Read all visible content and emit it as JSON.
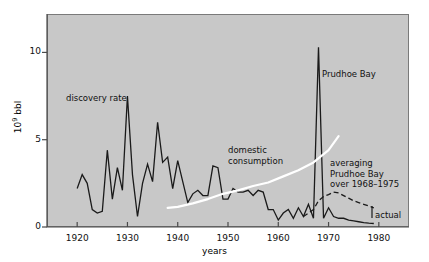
{
  "chart_data": {
    "type": "line",
    "title": "",
    "xlabel": "years",
    "ylabel_prefix": "10",
    "ylabel_exp": "9",
    "ylabel_suffix": " bbl",
    "xlim": [
      1914,
      1986
    ],
    "ylim": [
      0,
      12.2
    ],
    "xticks": [
      1920,
      1930,
      1940,
      1950,
      1960,
      1970,
      1980
    ],
    "xticklabels": [
      "1920",
      "1930",
      "1940",
      "1950",
      "1960",
      "1970",
      "1980"
    ],
    "yticks": [
      0,
      5,
      10
    ],
    "yticklabels": [
      "0",
      "5",
      "10"
    ],
    "grid": false,
    "legend": "none",
    "plot_bgcolor": "#c8c8c8",
    "series": [
      {
        "name": "discovery rate",
        "color": "#1a1a1a",
        "style": "solid",
        "x": [
          1920,
          1921,
          1922,
          1923,
          1924,
          1925,
          1926,
          1927,
          1928,
          1929,
          1930,
          1931,
          1932,
          1933,
          1934,
          1935,
          1936,
          1937,
          1938,
          1939,
          1940,
          1941,
          1942,
          1943,
          1944,
          1945,
          1946,
          1947,
          1948,
          1949,
          1950,
          1951,
          1952,
          1953,
          1954,
          1955,
          1956,
          1957,
          1958,
          1959,
          1960,
          1961,
          1962,
          1963,
          1964,
          1965,
          1966,
          1967,
          1968,
          1969,
          1970,
          1971,
          1972,
          1973,
          1974,
          1975,
          1976,
          1977,
          1978,
          1979
        ],
        "values": [
          2.2,
          3.0,
          2.5,
          1.0,
          0.8,
          0.9,
          4.4,
          1.6,
          3.4,
          2.1,
          7.5,
          3.0,
          0.6,
          2.5,
          3.6,
          2.6,
          6.0,
          3.7,
          4.0,
          2.2,
          3.8,
          2.6,
          1.4,
          1.9,
          2.1,
          1.8,
          1.8,
          3.5,
          3.4,
          1.6,
          1.6,
          2.2,
          2.0,
          2.0,
          2.1,
          1.8,
          2.1,
          2.0,
          1.0,
          1.0,
          0.4,
          0.8,
          1.0,
          0.5,
          1.1,
          0.6,
          1.3,
          0.5,
          10.3,
          0.5,
          1.1,
          0.6,
          0.5,
          0.5,
          0.4,
          0.35,
          0.3,
          0.25,
          0.22,
          0.2
        ]
      },
      {
        "name": "domestic consumption",
        "color": "#ffffff",
        "style": "solid",
        "x": [
          1938,
          1940,
          1943,
          1946,
          1949,
          1952,
          1955,
          1958,
          1961,
          1964,
          1967,
          1970,
          1972
        ],
        "values": [
          1.1,
          1.15,
          1.35,
          1.6,
          1.9,
          2.1,
          2.35,
          2.55,
          2.9,
          3.25,
          3.7,
          4.4,
          5.2
        ]
      },
      {
        "name": "averaging Prudhoe Bay over 1968-1975",
        "color": "#1a1a1a",
        "style": "dashed",
        "x": [
          1965,
          1967,
          1968,
          1969,
          1970,
          1971,
          1972,
          1973,
          1974,
          1975,
          1976,
          1977,
          1978,
          1979
        ],
        "values": [
          0.6,
          1.0,
          1.5,
          1.75,
          1.85,
          2.0,
          1.95,
          1.8,
          1.65,
          1.5,
          1.4,
          1.3,
          1.2,
          1.1
        ]
      }
    ],
    "annotations": [
      {
        "name": "discovery-rate-label",
        "text": "discovery rate",
        "x": 66,
        "y": 93
      },
      {
        "name": "domestic-consumption-label",
        "text": "domestic\nconsumption",
        "x": 228,
        "y": 145
      },
      {
        "name": "prudhoe-bay-label",
        "text": "Prudhoe Bay",
        "x": 322,
        "y": 69
      },
      {
        "name": "averaging-label",
        "text": "averaging\nPrudhoe Bay\nover 1968–1975",
        "x": 330,
        "y": 158
      },
      {
        "name": "actual-label",
        "text": "actual",
        "x": 375,
        "y": 210
      }
    ]
  }
}
